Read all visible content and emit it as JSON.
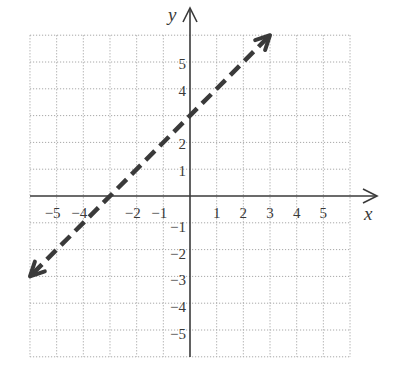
{
  "chart_data": {
    "type": "line",
    "title": "",
    "xlabel": "x",
    "ylabel": "y",
    "xlim": [
      -6,
      6
    ],
    "ylim": [
      -6,
      6
    ],
    "grid": true,
    "grid_style": "dotted",
    "x_ticks": [
      -5,
      -4,
      -2,
      -1,
      1,
      2,
      3,
      4,
      5
    ],
    "x_tick_labels": [
      "−5",
      "−4",
      "−2",
      "−1",
      "1",
      "2",
      "3",
      "4",
      "5"
    ],
    "y_ticks": [
      5,
      4,
      2,
      1,
      -1,
      -2,
      -3,
      -4,
      -5
    ],
    "y_tick_labels": [
      "5",
      "4",
      "2",
      "1",
      "−1",
      "−2",
      "−3",
      "−4",
      "−5"
    ],
    "series": [
      {
        "name": "y = x + 3",
        "style": "dashed",
        "arrows": "both",
        "equation": "y = x + 3",
        "slope": 1,
        "intercept": 3,
        "x": [
          -6,
          3
        ],
        "y": [
          -3,
          6
        ]
      }
    ],
    "legend": null
  },
  "colors": {
    "line": "#3a3a3a",
    "grid": "#a8a8a8",
    "background": "#ffffff"
  }
}
